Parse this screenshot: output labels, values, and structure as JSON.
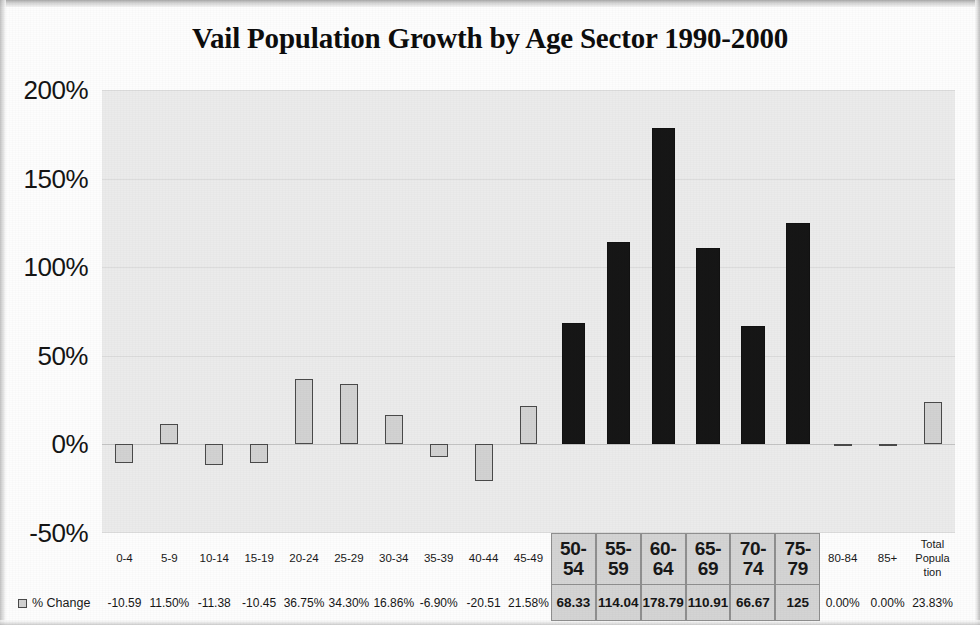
{
  "page": {
    "title": "Vail Population Growth by Age Sector 1990-2000"
  },
  "legend": {
    "swatch_icon": "square-swatch-icon",
    "label": "% Change"
  },
  "axis": {
    "y_ticks": [
      "200%",
      "150%",
      "100%",
      "50%",
      "0%",
      "-50%"
    ]
  },
  "chart_data": {
    "type": "bar",
    "title": "Vail Population Growth by Age Sector 1990-2000",
    "xlabel": "",
    "ylabel": "",
    "ylim": [
      -50,
      200
    ],
    "ytick_values": [
      200,
      150,
      100,
      50,
      0,
      -50
    ],
    "grid": true,
    "legend": [
      "% Change"
    ],
    "legend_position": "bottom-left",
    "categories": [
      "0-4",
      "5-9",
      "10-14",
      "15-19",
      "20-24",
      "25-29",
      "30-34",
      "35-39",
      "40-44",
      "45-49",
      "50-54",
      "55-59",
      "60-64",
      "65-69",
      "70-74",
      "75-79",
      "80-84",
      "85+",
      "Total Population"
    ],
    "category_labels": [
      "0-4",
      "5-9",
      "10-14",
      "15-19",
      "20-24",
      "25-29",
      "30-34",
      "35-39",
      "40-44",
      "45-49",
      "50-\n54",
      "55-\n59",
      "60-\n64",
      "65-\n69",
      "70-\n74",
      "75-\n79",
      "80-84",
      "85+",
      "Total\nPopula\ntion"
    ],
    "series": [
      {
        "name": "% Change",
        "values": [
          -10.59,
          11.5,
          -11.38,
          -10.45,
          36.75,
          34.3,
          16.86,
          -6.9,
          -20.51,
          21.58,
          68.33,
          114.04,
          178.79,
          110.91,
          66.67,
          125.0,
          0.0,
          0.0,
          23.83
        ]
      }
    ],
    "value_labels": [
      "-10.59",
      "11.50%",
      "-11.38",
      "-10.45",
      "36.75%",
      "34.30%",
      "16.86%",
      "-6.90%",
      "-20.51",
      "21.58%",
      "68.33",
      "114.04",
      "178.79",
      "110.91",
      "66.67",
      "125",
      "0.00%",
      "0.00%",
      "23.83%"
    ],
    "highlighted": [
      false,
      false,
      false,
      false,
      false,
      false,
      false,
      false,
      false,
      false,
      true,
      true,
      true,
      true,
      true,
      true,
      false,
      false,
      false
    ],
    "colors": {
      "bar_normal": "#d2d2d2",
      "bar_highlight": "#161616",
      "bar_border": "#4a4a4a",
      "plot_background": "#ebebeb",
      "highlight_cell_background": "#d4d4d4"
    }
  }
}
